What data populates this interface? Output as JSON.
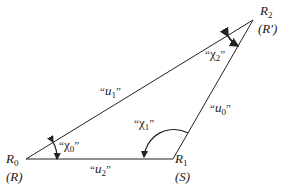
{
  "diagram": {
    "type": "triangle",
    "vertices": [
      {
        "id": "R0",
        "name": "R",
        "sub": "0",
        "alias": "(R)",
        "x": 26,
        "y": 159
      },
      {
        "id": "R1",
        "name": "R",
        "sub": "1",
        "alias": "(S)",
        "x": 173,
        "y": 159
      },
      {
        "id": "R2",
        "name": "R",
        "sub": "2",
        "alias": "(R′)",
        "x": 253,
        "y": 20
      }
    ],
    "sides": [
      {
        "id": "u0",
        "name": "u",
        "sub": "0",
        "from": "R1",
        "to": "R2"
      },
      {
        "id": "u1",
        "name": "u",
        "sub": "1",
        "from": "R0",
        "to": "R2"
      },
      {
        "id": "u2",
        "name": "u",
        "sub": "2",
        "from": "R0",
        "to": "R1"
      }
    ],
    "angles": [
      {
        "id": "chi0",
        "name": "χ",
        "sub": "0",
        "vertex": "R0"
      },
      {
        "id": "chi1",
        "name": "χ",
        "sub": "1",
        "vertex": "R1"
      },
      {
        "id": "chi2",
        "name": "χ",
        "sub": "2",
        "vertex": "R2"
      }
    ],
    "quote_open": "“",
    "quote_close": "”",
    "line_color": "#222222"
  }
}
